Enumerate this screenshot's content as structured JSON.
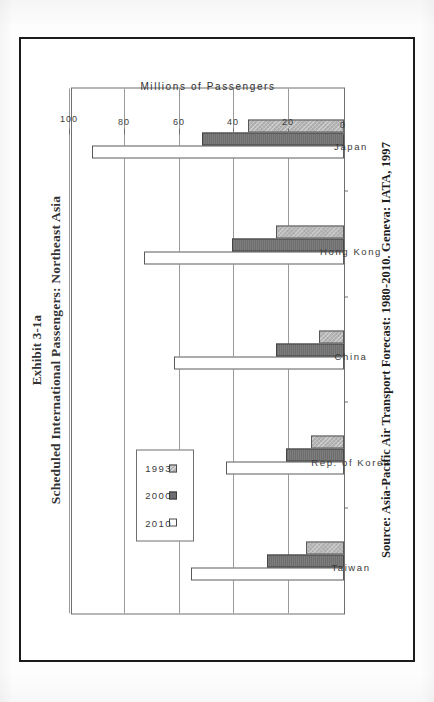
{
  "exhibit": {
    "number": "Exhibit 3-1a",
    "title": "Scheduled International Passengers: Northeast Asia",
    "source_note": "Source: Asia-Pacific Air Transport Forecast: 1980-2010. Geneva: IATA, 1997"
  },
  "legend": {
    "items": [
      {
        "label": "2010",
        "swatch": "open-white-square",
        "color": "#ffffff"
      },
      {
        "label": "2000",
        "swatch": "dark-gray-square",
        "color": "#6e6e6e"
      },
      {
        "label": "1993",
        "swatch": "light-gray-hatched-square",
        "color": "#b4b4b4"
      }
    ]
  },
  "chart_data": {
    "type": "bar",
    "title": "Scheduled International Passengers: Northeast Asia",
    "subtitle": "Exhibit 3-1a",
    "orientation": "vertical-grouped-bars-printed-sideways",
    "categories": [
      "Taiwan",
      "Rep. of Korea",
      "China",
      "Hong Kong",
      "Japan"
    ],
    "series": [
      {
        "name": "2010",
        "values": [
          56,
          43,
          62,
          73,
          92
        ]
      },
      {
        "name": "2000",
        "values": [
          28,
          21,
          25,
          41,
          52
        ]
      },
      {
        "name": "1993",
        "values": [
          14,
          12,
          9,
          25,
          35
        ]
      }
    ],
    "xlabel": "",
    "ylabel": "Millions of Passengers",
    "ylim": [
      0,
      100
    ],
    "yticks": [
      0,
      20,
      40,
      60,
      80,
      100
    ],
    "ytick_labels": [
      "0",
      "20",
      "40",
      "60",
      "80",
      "100"
    ],
    "grid": true,
    "legend_position": "top-left-inside"
  }
}
